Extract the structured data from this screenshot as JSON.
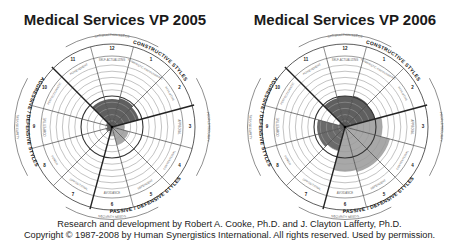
{
  "titles": {
    "left": "Medical Services VP 2005",
    "right": "Medical Services VP 2006"
  },
  "footer": {
    "line1": "Research and development by Robert A. Cooke, Ph.D. and J. Clayton Lafferty, Ph.D.",
    "line2": "Copyright © 1987-2008 by Human Synergistics International. All rights reserved. Used by permission."
  },
  "circumplex": {
    "segment_numbers": [
      "12",
      "1",
      "2",
      "3",
      "4",
      "5",
      "6",
      "7",
      "8",
      "9",
      "10",
      "11"
    ],
    "segment_labels": [
      "SELF-ACTUALIZING",
      "HUMANISTIC-ENCOURAGING",
      "AFFILIATIVE",
      "APPROVAL",
      "CONVENTIONAL",
      "DEPENDENT",
      "AVOIDANCE",
      "OPPOSITIONAL",
      "POWER",
      "COMPETITIVE",
      "PERFECTIONISTIC",
      "ACHIEVEMENT"
    ],
    "group_labels": {
      "constructive": "CONSTRUCTIVE STYLES",
      "passive": "PASSIVE / DEFENSIVE STYLES",
      "aggressive": "AGGRESSIVE / DEFENSIVE STYLES"
    },
    "outer_labels": {
      "top": "SATISFACTION NEEDS",
      "right": "PEOPLE/SECURITY",
      "bottom": "SECURITY NEEDS",
      "left": "TASK/SECURITY"
    },
    "colors": {
      "constructive": "#5f5f5f",
      "passive": "#a8a8a8",
      "aggressive": "#6a6a6a",
      "grid": "#7a7a7a",
      "thick": "#222222"
    }
  },
  "chart_data": [
    {
      "type": "circumplex",
      "title": "Medical Services VP 2005",
      "categories": [
        "12 Self-Actualizing",
        "1 Humanistic-Encouraging",
        "2 Affiliative",
        "3 Approval",
        "4 Conventional",
        "5 Dependent",
        "6 Avoidance",
        "7 Oppositional",
        "8 Power",
        "9 Competitive",
        "10 Perfectionistic",
        "11 Achievement"
      ],
      "percentile_scale": [
        0,
        100
      ],
      "values": [
        45,
        48,
        45,
        20,
        28,
        30,
        15,
        8,
        10,
        8,
        10,
        45
      ]
    },
    {
      "type": "circumplex",
      "title": "Medical Services VP 2006",
      "categories": [
        "12 Self-Actualizing",
        "1 Humanistic-Encouraging",
        "2 Affiliative",
        "3 Approval",
        "4 Conventional",
        "5 Dependent",
        "6 Avoidance",
        "7 Oppositional",
        "8 Power",
        "9 Competitive",
        "10 Perfectionistic",
        "11 Achievement"
      ],
      "percentile_scale": [
        0,
        100
      ],
      "values": [
        50,
        52,
        50,
        60,
        75,
        75,
        72,
        40,
        45,
        45,
        10,
        48
      ]
    }
  ]
}
